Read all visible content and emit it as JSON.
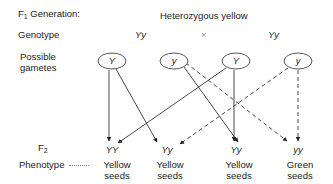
{
  "header": {
    "generation_label": "F",
    "generation_sub": "1",
    "generation_suffix": " Generation:",
    "title": "Heterozygous yellow"
  },
  "rows": {
    "genotype_label": "Genotype",
    "gametes_label_1": "Possible",
    "gametes_label_2": "gametes",
    "f2_label": "F",
    "f2_sub": "2",
    "phenotype_label": "Phenotype"
  },
  "parents": {
    "left_genotype": "Yy",
    "cross_symbol": "×",
    "right_genotype": "Yy"
  },
  "gametes": [
    {
      "allele": "Y",
      "parent": "left"
    },
    {
      "allele": "y",
      "parent": "left"
    },
    {
      "allele": "Y",
      "parent": "right"
    },
    {
      "allele": "y",
      "parent": "right"
    }
  ],
  "offspring": [
    {
      "genotype": "YY",
      "phenotype_1": "Yellow",
      "phenotype_2": "seeds"
    },
    {
      "genotype": "Yy",
      "phenotype_1": "Yellow",
      "phenotype_2": "seeds"
    },
    {
      "genotype": "Yy",
      "phenotype_1": "Yellow",
      "phenotype_2": "seeds"
    },
    {
      "genotype": "yy",
      "phenotype_1": "Green",
      "phenotype_2": "seeds"
    }
  ],
  "arrows": [
    {
      "from": "gamete-0",
      "to": "offspring-0",
      "style": "solid"
    },
    {
      "from": "gamete-0",
      "to": "offspring-1",
      "style": "solid"
    },
    {
      "from": "gamete-1",
      "to": "offspring-2",
      "style": "solid"
    },
    {
      "from": "gamete-1",
      "to": "offspring-3",
      "style": "dashed"
    },
    {
      "from": "gamete-2",
      "to": "offspring-0",
      "style": "solid"
    },
    {
      "from": "gamete-2",
      "to": "offspring-2",
      "style": "solid"
    },
    {
      "from": "gamete-3",
      "to": "offspring-1",
      "style": "dashed"
    },
    {
      "from": "gamete-3",
      "to": "offspring-3",
      "style": "dashed"
    }
  ]
}
